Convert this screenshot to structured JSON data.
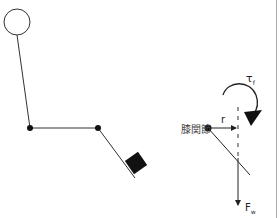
{
  "figure": {
    "left_panel": {
      "description": "stick figure of leg with head circle, hip and knee joints, and foot weight"
    },
    "right_panel": {
      "joint_label": "膝関節",
      "lever_arm_label": "r",
      "torque_label": "τ",
      "torque_subscript": "f",
      "force_label": "F",
      "force_subscript": "w"
    },
    "colors": {
      "line": "#222222",
      "background": "#ffffff",
      "border": "#999999"
    }
  }
}
